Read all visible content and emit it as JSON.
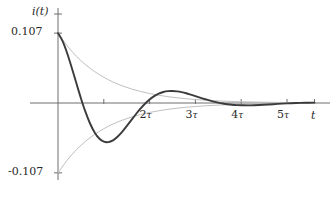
{
  "figure": {
    "type": "line-plot",
    "background": "#ffffff"
  },
  "axes": {
    "y_axis_label": "i(t)",
    "x_axis_label": "t",
    "y_ticks": [
      {
        "label": "0.107",
        "value": 0.107
      },
      {
        "label": "-0.107",
        "value": -0.107
      }
    ],
    "x_ticks": [
      {
        "label": "",
        "tau": 1,
        "value": 1
      },
      {
        "label": "2",
        "tau": 2,
        "value": 2
      },
      {
        "label": "3",
        "tau": 3,
        "value": 3
      },
      {
        "label": "4",
        "tau": 4,
        "value": 4
      },
      {
        "label": "5",
        "tau": 5,
        "value": 5
      }
    ],
    "tau_symbol": "τ"
  },
  "colors": {
    "signal": "#3b3b3b",
    "envelope": "#bfbfbf",
    "axis": "#6e6e6e",
    "text": "#2a2a2a"
  },
  "chart_data": {
    "type": "line",
    "title": "",
    "subtitle": "",
    "xlabel": "t",
    "ylabel": "i(t)",
    "xlim": [
      0,
      5.6
    ],
    "ylim": [
      -0.107,
      0.107
    ],
    "grid": false,
    "legend": "none",
    "x_unit": "τ",
    "annotations": [],
    "series": [
      {
        "name": "i(t) damped oscillation",
        "color": "#3b3b3b",
        "width": 1.9,
        "x": [
          0,
          0.1,
          0.2,
          0.3,
          0.4,
          0.5,
          0.6,
          0.7,
          0.8,
          0.9,
          1.0,
          1.1,
          1.2,
          1.3,
          1.4,
          1.5,
          1.6,
          1.7,
          1.8,
          1.9,
          2.0,
          2.1,
          2.2,
          2.3,
          2.4,
          2.5,
          2.6,
          2.7,
          2.8,
          2.9,
          3.0,
          3.1,
          3.2,
          3.3,
          3.4,
          3.5,
          3.6,
          3.7,
          3.8,
          3.9,
          4.0,
          4.2,
          4.4,
          4.6,
          4.8,
          5.0,
          5.2,
          5.4,
          5.6
        ],
        "y": [
          0.107,
          0.0946,
          0.0762,
          0.0541,
          0.0305,
          0.0074,
          -0.0136,
          -0.0314,
          -0.0451,
          -0.0544,
          -0.0592,
          -0.0599,
          -0.0572,
          -0.0517,
          -0.0442,
          -0.0355,
          -0.0263,
          -0.0172,
          -0.0087,
          -0.0011,
          0.0053,
          0.0105,
          0.0143,
          0.0168,
          0.0181,
          0.0184,
          0.0178,
          0.0166,
          0.0149,
          0.0128,
          0.0106,
          0.0083,
          0.0061,
          0.004,
          0.0021,
          0.0005,
          -0.0008,
          -0.0019,
          -0.0027,
          -0.0032,
          -0.0035,
          -0.0036,
          -0.0031,
          -0.0023,
          -0.0014,
          -0.0006,
          0.0,
          0.0004,
          0.0006
        ]
      },
      {
        "name": "upper exponential envelope",
        "color": "#bfbfbf",
        "width": 1.0,
        "x": [
          0,
          0.2,
          0.4,
          0.6,
          0.8,
          1.0,
          1.2,
          1.4,
          1.6,
          1.8,
          2.0,
          2.2,
          2.4,
          2.6,
          2.8,
          3.0,
          3.2,
          3.4,
          3.6,
          3.8,
          4.0,
          4.3,
          4.6,
          5.0,
          5.4,
          5.6
        ],
        "y": [
          0.107,
          0.0876,
          0.0717,
          0.0587,
          0.0481,
          0.0394,
          0.0322,
          0.0264,
          0.0216,
          0.0177,
          0.0145,
          0.0119,
          0.0097,
          0.008,
          0.0065,
          0.0053,
          0.0044,
          0.0036,
          0.0029,
          0.0024,
          0.002,
          0.0015,
          0.0011,
          0.0007,
          0.0005,
          0.0004
        ]
      },
      {
        "name": "lower exponential envelope",
        "color": "#bfbfbf",
        "width": 1.0,
        "x": [
          0,
          0.2,
          0.4,
          0.6,
          0.8,
          1.0,
          1.2,
          1.4,
          1.6,
          1.8,
          2.0,
          2.2,
          2.4,
          2.6,
          2.8,
          3.0,
          3.2,
          3.4,
          3.6,
          3.8,
          4.0,
          4.3,
          4.6,
          5.0,
          5.4,
          5.6
        ],
        "y": [
          -0.107,
          -0.0876,
          -0.0717,
          -0.0587,
          -0.0481,
          -0.0394,
          -0.0322,
          -0.0264,
          -0.0216,
          -0.0177,
          -0.0145,
          -0.0119,
          -0.0097,
          -0.008,
          -0.0065,
          -0.0053,
          -0.0044,
          -0.0036,
          -0.0029,
          -0.0024,
          -0.002,
          -0.0015,
          -0.0011,
          -0.0007,
          -0.0005,
          -0.0004
        ]
      }
    ]
  }
}
